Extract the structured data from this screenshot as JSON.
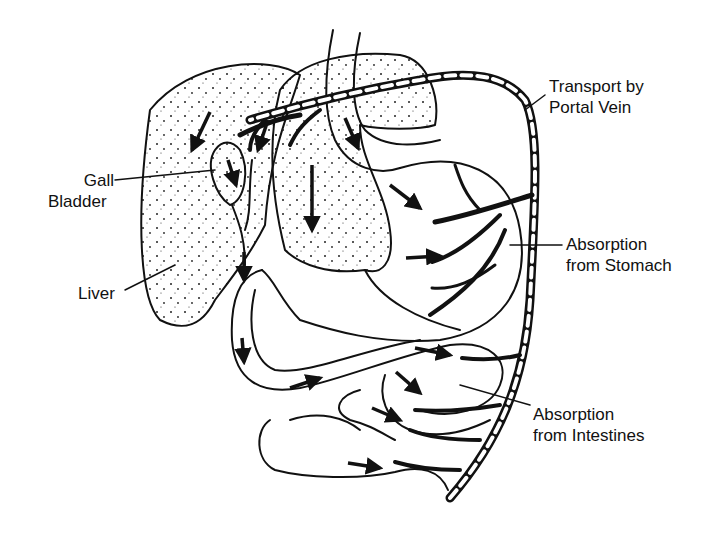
{
  "diagram": {
    "type": "anatomical illustration",
    "colors": {
      "ink": "#111111",
      "background": "#ffffff"
    },
    "labels": {
      "portal_vein": {
        "line1": "Transport by",
        "line2": "Portal Vein"
      },
      "gall_bladder": {
        "line1": "Gall",
        "line2": "Bladder"
      },
      "liver": {
        "line1": "Liver"
      },
      "stomach": {
        "line1": "Absorption",
        "line2": "from Stomach"
      },
      "intestines": {
        "line1": "Absorption",
        "line2": "from Intestines"
      }
    },
    "nodes": [
      "Liver",
      "Gall Bladder",
      "Stomach",
      "Intestines",
      "Portal Vein"
    ],
    "edges": [
      {
        "from": "Stomach",
        "to": "Portal Vein",
        "label": "Absorption from Stomach"
      },
      {
        "from": "Intestines",
        "to": "Portal Vein",
        "label": "Absorption from Intestines"
      },
      {
        "from": "Portal Vein",
        "to": "Liver",
        "label": "Transport by Portal Vein"
      },
      {
        "from": "Liver",
        "to": "Gall Bladder",
        "label": ""
      },
      {
        "from": "Gall Bladder",
        "to": "Intestines",
        "label": ""
      }
    ]
  }
}
